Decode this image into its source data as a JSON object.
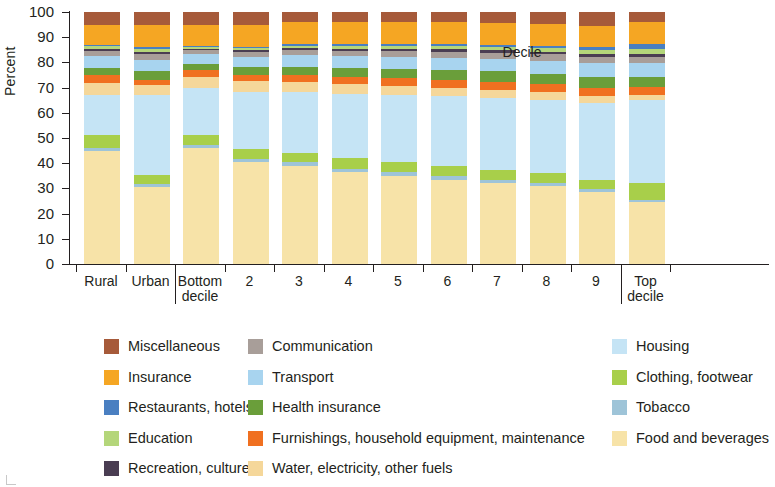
{
  "chart_data": {
    "type": "bar",
    "subtype": "stacked-bar-100-percent",
    "title": "",
    "xlabel": "Decile",
    "ylabel": "Percent",
    "ylim": [
      0,
      100
    ],
    "ytick_values": [
      0,
      10,
      20,
      30,
      40,
      50,
      60,
      70,
      80,
      90,
      100
    ],
    "grid": false,
    "legend_position": "bottom",
    "categories": [
      "Rural",
      "Urban",
      "Bottom decile",
      "2",
      "3",
      "4",
      "5",
      "6",
      "7",
      "8",
      "9",
      "Top decile"
    ],
    "category_groups": [
      {
        "label": "",
        "categories": [
          "Rural",
          "Urban"
        ]
      },
      {
        "label": "Decile",
        "categories": [
          "Bottom decile",
          "2",
          "3",
          "4",
          "5",
          "6",
          "7",
          "8",
          "9",
          "Top decile"
        ]
      }
    ],
    "series": [
      {
        "name": "Food and beverages",
        "color": "#f7e3a8",
        "values": [
          45.0,
          30.5,
          46.0,
          40.5,
          39.0,
          36.5,
          35.0,
          33.5,
          32.0,
          31.0,
          28.5,
          24.5
        ]
      },
      {
        "name": "Tobacco",
        "color": "#9ec4d8",
        "values": [
          1.2,
          1.2,
          1.3,
          1.3,
          1.3,
          1.4,
          1.4,
          1.3,
          1.3,
          1.2,
          1.2,
          1.0
        ]
      },
      {
        "name": "Clothing, footwear",
        "color": "#a8cf4a",
        "values": [
          5.0,
          3.5,
          4.0,
          3.8,
          3.9,
          4.0,
          4.1,
          4.2,
          4.2,
          4.0,
          3.8,
          6.5
        ]
      },
      {
        "name": "Housing",
        "color": "#c5e4f5",
        "values": [
          16.0,
          32.0,
          18.5,
          22.5,
          24.0,
          25.5,
          26.5,
          27.5,
          28.5,
          29.0,
          30.5,
          33.0
        ]
      },
      {
        "name": "Water, electricity, other fuels",
        "color": "#f5d79a",
        "values": [
          4.5,
          4.0,
          4.5,
          4.5,
          4.2,
          4.0,
          3.8,
          3.5,
          3.2,
          3.0,
          2.8,
          2.2
        ]
      },
      {
        "name": "Furnishings, household equipment, maintenance",
        "color": "#f07020",
        "values": [
          3.2,
          1.8,
          2.5,
          2.6,
          2.7,
          2.8,
          2.9,
          3.0,
          3.1,
          3.1,
          3.2,
          3.0
        ]
      },
      {
        "name": "Health insurance",
        "color": "#6a9e3a",
        "values": [
          3.0,
          3.5,
          2.5,
          2.8,
          3.2,
          3.6,
          3.8,
          4.0,
          4.2,
          4.3,
          4.4,
          4.0
        ]
      },
      {
        "name": "Transport",
        "color": "#a8d4ef",
        "values": [
          4.8,
          4.5,
          4.0,
          4.3,
          4.5,
          4.7,
          4.8,
          4.9,
          5.0,
          5.1,
          5.3,
          5.5
        ]
      },
      {
        "name": "Communication",
        "color": "#a89e99",
        "values": [
          2.0,
          2.3,
          1.6,
          1.9,
          2.1,
          2.2,
          2.3,
          2.4,
          2.4,
          2.5,
          2.5,
          2.3
        ]
      },
      {
        "name": "Recreation, culture",
        "color": "#4a3d52",
        "values": [
          0.7,
          0.8,
          0.5,
          0.6,
          0.7,
          0.8,
          0.8,
          0.9,
          0.9,
          1.0,
          1.0,
          1.2
        ]
      },
      {
        "name": "Education",
        "color": "#b4d67a",
        "values": [
          1.1,
          1.2,
          0.8,
          1.0,
          1.1,
          1.2,
          1.3,
          1.3,
          1.4,
          1.5,
          1.6,
          2.0
        ]
      },
      {
        "name": "Restaurants, hotels",
        "color": "#4a7fc1",
        "values": [
          0.5,
          0.7,
          0.3,
          0.4,
          0.5,
          0.6,
          0.7,
          0.8,
          0.9,
          1.0,
          1.2,
          2.3
        ]
      },
      {
        "name": "Insurance",
        "color": "#f5a623",
        "values": [
          8.0,
          9.0,
          8.5,
          8.8,
          8.9,
          8.9,
          8.8,
          8.8,
          8.7,
          8.5,
          8.5,
          8.5
        ]
      },
      {
        "name": "Miscellaneous",
        "color": "#a65a3a",
        "values": [
          5.0,
          5.0,
          5.0,
          5.0,
          3.9,
          3.8,
          3.8,
          4.0,
          4.2,
          4.8,
          5.5,
          4.0
        ]
      }
    ]
  },
  "axis": {
    "ylabel": "Percent",
    "xlabel": "Decile",
    "yticks": [
      "100",
      "90",
      "80",
      "70",
      "60",
      "50",
      "40",
      "30",
      "20",
      "10",
      "0"
    ],
    "xlabels": [
      {
        "text": "Rural",
        "line2": ""
      },
      {
        "text": "Urban",
        "line2": ""
      },
      {
        "text": "Bottom",
        "line2": "decile"
      },
      {
        "text": "2",
        "line2": ""
      },
      {
        "text": "3",
        "line2": ""
      },
      {
        "text": "4",
        "line2": ""
      },
      {
        "text": "5",
        "line2": ""
      },
      {
        "text": "6",
        "line2": ""
      },
      {
        "text": "7",
        "line2": ""
      },
      {
        "text": "8",
        "line2": ""
      },
      {
        "text": "9",
        "line2": ""
      },
      {
        "text": "Top",
        "line2": "decile"
      }
    ]
  },
  "legend": {
    "columns": [
      [
        {
          "label": "Miscellaneous",
          "color": "#a65a3a"
        },
        {
          "label": "Insurance",
          "color": "#f5a623"
        },
        {
          "label": "Restaurants, hotels",
          "color": "#4a7fc1"
        },
        {
          "label": "Education",
          "color": "#b4d67a"
        },
        {
          "label": "Recreation, culture",
          "color": "#4a3d52"
        }
      ],
      [
        {
          "label": "Communication",
          "color": "#a89e99"
        },
        {
          "label": "Transport",
          "color": "#a8d4ef"
        },
        {
          "label": "Health insurance",
          "color": "#6a9e3a"
        },
        {
          "label": "Furnishings, household equipment, maintenance",
          "color": "#f07020"
        },
        {
          "label": "Water, electricity, other fuels",
          "color": "#f5d79a"
        }
      ],
      [
        {
          "label": "Housing",
          "color": "#c5e4f5"
        },
        {
          "label": "Clothing, footwear",
          "color": "#a8cf4a"
        },
        {
          "label": "Tobacco",
          "color": "#9ec4d8"
        },
        {
          "label": "Food and beverages",
          "color": "#f7e3a8"
        }
      ]
    ]
  }
}
